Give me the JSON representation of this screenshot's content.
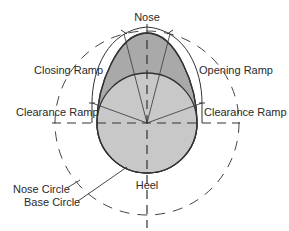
{
  "diagram": {
    "type": "cam-lobe-profile",
    "labels": {
      "nose": "Nose",
      "closing_ramp": "Closing Ramp",
      "opening_ramp": "Opening Ramp",
      "clearance_ramp_left": "Clearance Ramp",
      "clearance_ramp_right": "Clearance Ramp",
      "heel": "Heel",
      "nose_circle": "Nose Circle",
      "base_circle": "Base Circle"
    },
    "colors": {
      "lobe_fill": "#c8c8c8",
      "nose_fill": "#a9a9a9",
      "stroke": "#333333",
      "dash": "#444444",
      "background": "#ffffff"
    }
  }
}
